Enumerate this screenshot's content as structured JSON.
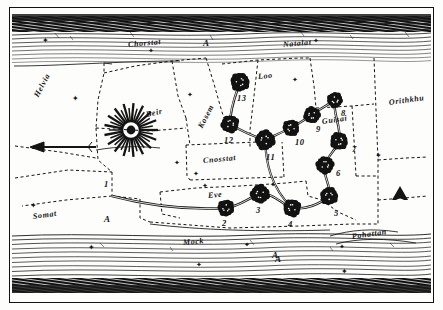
{
  "document": {
    "title": "Antique hand-drawn route map engraving",
    "medium": "engraving",
    "ink_color": "#121212",
    "paper_color": "#fdfdfb"
  },
  "map": {
    "top_band_label_left": "Chorstat",
    "top_band_label_left_mark": "A",
    "top_band_label_right": "Natalat",
    "bottom_band_label_center": "Mock",
    "bottom_band_label_center_mark": "A",
    "bottom_band_label_right": "Pohattan",
    "regions": [
      {
        "name": "Helvia",
        "x": 36,
        "y": 92,
        "rot": "rot-n58"
      },
      {
        "name": "Beir",
        "x": 146,
        "y": 110,
        "rot": "rot-n12"
      },
      {
        "name": "Kosem",
        "x": 200,
        "y": 123,
        "rot": "rot-n58"
      },
      {
        "name": "Loo",
        "x": 258,
        "y": 72,
        "rot": "rot-n5"
      },
      {
        "name": "Guisai",
        "x": 322,
        "y": 117,
        "rot": "rot-n8"
      },
      {
        "name": "Orithkhu",
        "x": 389,
        "y": 98,
        "rot": "rot-n8"
      },
      {
        "name": "Cnosstat",
        "x": 203,
        "y": 156,
        "rot": "rot-n5"
      },
      {
        "name": "Eve",
        "x": 208,
        "y": 191,
        "rot": "rot-n5"
      },
      {
        "name": "Somat",
        "x": 33,
        "y": 212,
        "rot": "rot-n8"
      }
    ],
    "marks": [
      {
        "label": "A",
        "x": 104,
        "y": 214
      },
      {
        "label": "A",
        "x": 275,
        "y": 254
      }
    ],
    "nodes": [
      {
        "id": "1",
        "cx": 111,
        "cy": 183,
        "r": 0,
        "lx": 104,
        "ly": 179
      },
      {
        "id": "2",
        "cx": 226,
        "cy": 208,
        "r": 7.5,
        "lx": 222,
        "ly": 218
      },
      {
        "id": "3",
        "cx": 260,
        "cy": 194,
        "r": 8.5,
        "lx": 256,
        "ly": 205
      },
      {
        "id": "4",
        "cx": 292,
        "cy": 208,
        "r": 8,
        "lx": 288,
        "ly": 219
      },
      {
        "id": "5",
        "cx": 329,
        "cy": 196,
        "r": 8,
        "lx": 334,
        "ly": 208
      },
      {
        "id": "6",
        "cx": 325,
        "cy": 165,
        "r": 8,
        "lx": 336,
        "ly": 168
      },
      {
        "id": "7",
        "cx": 339,
        "cy": 141,
        "r": 8,
        "lx": 352,
        "ly": 144
      },
      {
        "id": "8",
        "cx": 335,
        "cy": 100,
        "r": 7,
        "lx": 341,
        "ly": 108
      },
      {
        "id": "9",
        "cx": 312,
        "cy": 115,
        "r": 7.5,
        "lx": 316,
        "ly": 124
      },
      {
        "id": "10",
        "cx": 291,
        "cy": 128,
        "r": 7.5,
        "lx": 295,
        "ly": 137
      },
      {
        "id": "11",
        "cx": 265,
        "cy": 140,
        "r": 9,
        "lx": 266,
        "ly": 152
      },
      {
        "id": "12",
        "cx": 230,
        "cy": 124,
        "r": 8,
        "lx": 224,
        "ly": 135
      },
      {
        "id": "13",
        "cx": 240,
        "cy": 82,
        "r": 8.5,
        "lx": 237,
        "ly": 93
      }
    ],
    "route_order": [
      "1",
      "2",
      "3",
      "4",
      "5",
      "6",
      "7",
      "8",
      "9",
      "10",
      "11",
      "12",
      "13"
    ],
    "compass_arrow": {
      "direction": "west",
      "x1": 96,
      "y1": 147,
      "x2": 34,
      "y2": 147
    },
    "triangle_marker": {
      "x": 400,
      "y": 193,
      "label": ""
    },
    "sunburst": {
      "cx": 131,
      "cy": 130,
      "rays": 34,
      "inner_r": 9,
      "outer_r": 27
    },
    "stars": [
      {
        "x": 42,
        "y": 37
      },
      {
        "x": 148,
        "y": 47
      },
      {
        "x": 313,
        "y": 37
      },
      {
        "x": 72,
        "y": 95
      },
      {
        "x": 292,
        "y": 76
      },
      {
        "x": 187,
        "y": 91
      },
      {
        "x": 375,
        "y": 152
      },
      {
        "x": 174,
        "y": 159
      },
      {
        "x": 193,
        "y": 170
      },
      {
        "x": 30,
        "y": 202
      },
      {
        "x": 202,
        "y": 182
      },
      {
        "x": 270,
        "y": 181
      },
      {
        "x": 88,
        "y": 244
      },
      {
        "x": 244,
        "y": 241
      },
      {
        "x": 196,
        "y": 261
      },
      {
        "x": 341,
        "y": 268
      },
      {
        "x": 339,
        "y": 243
      }
    ]
  }
}
